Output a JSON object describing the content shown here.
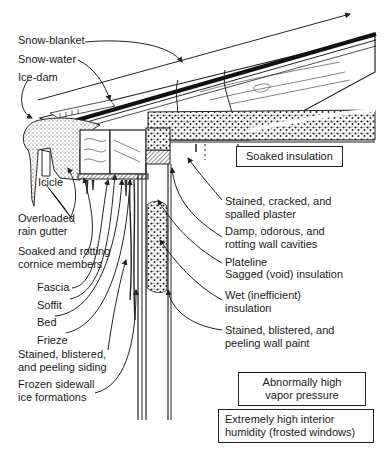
{
  "diagram": {
    "left_labels": {
      "snow_blanket": "Snow-blanket",
      "snow_water": "Snow-water",
      "ice_dam": "Ice-dam",
      "icicle": "Icicle",
      "overloaded_gutter": [
        "Overloaded",
        "rain gutter"
      ],
      "cornice_members": [
        "Soaked and rotting",
        "cornice members"
      ],
      "fascia": "Fascia",
      "soffit": "Soffit",
      "bed": "Bed",
      "frieze": "Frieze",
      "siding": [
        "Stained, blistered,",
        "and peeling siding"
      ],
      "sidewall_ice": [
        "Frozen sidewall",
        "ice formations"
      ]
    },
    "right_labels": {
      "soaked_insulation": "Soaked insulation",
      "plaster": [
        "Stained, cracked, and",
        "spalled plaster"
      ],
      "wall_cavities": [
        "Damp, odorous, and",
        "rotting wall cavities"
      ],
      "plateline": "Plateline",
      "sagged_insulation": "Sagged (void) insulation",
      "wet_insulation": [
        "Wet (inefficient)",
        "insulation"
      ],
      "wall_paint": [
        "Stained, blistered, and",
        "peeling wall paint"
      ]
    },
    "boxes": {
      "vapor_pressure": [
        "Abnormally high",
        "vapor pressure"
      ],
      "interior_humidity": [
        "Extremely high interior",
        "humidity (frosted windows)"
      ]
    },
    "colors": {
      "ink": "#1a1a1a",
      "paper": "#ffffff"
    }
  }
}
